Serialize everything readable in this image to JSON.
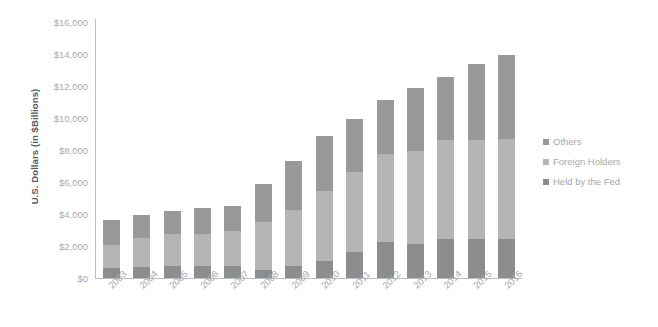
{
  "chart_data": {
    "type": "bar",
    "stacked": true,
    "title": "",
    "xlabel": "",
    "ylabel": "U.S. Dollars (in $Billions)",
    "categories": [
      "2003",
      "2004",
      "2005",
      "2006",
      "2007",
      "2008",
      "2009",
      "2010",
      "2011",
      "2012",
      "2013",
      "2014",
      "2015",
      "2016"
    ],
    "series": [
      {
        "name": "Held by the Fed",
        "color": "#8c8d8f",
        "values": [
          650,
          700,
          725,
          750,
          750,
          475,
          750,
          1050,
          1650,
          2250,
          2150,
          2450,
          2450,
          2450
        ]
      },
      {
        "name": "Foreign Holders",
        "color": "#b4b5b7",
        "values": [
          1400,
          1800,
          2000,
          2000,
          2200,
          3000,
          3500,
          4400,
          5000,
          5500,
          5800,
          6150,
          6200,
          6250
        ]
      },
      {
        "name": "Others",
        "color": "#97999b",
        "values": [
          1600,
          1450,
          1475,
          1600,
          1550,
          2400,
          3050,
          3400,
          3300,
          3350,
          3950,
          3950,
          4700,
          5250
        ]
      }
    ],
    "y_ticks": [
      {
        "label": "$16,000",
        "value": 16000
      },
      {
        "label": "$14,000",
        "value": 14000
      },
      {
        "label": "$12,000",
        "value": 12000
      },
      {
        "label": "$10,000",
        "value": 10000
      },
      {
        "label": "$8,000",
        "value": 8000
      },
      {
        "label": "$6,000",
        "value": 6000
      },
      {
        "label": "$4,000",
        "value": 4000
      },
      {
        "label": "$2,000",
        "value": 2000
      },
      {
        "label": "$0",
        "value": 0
      }
    ],
    "ylim": [
      0,
      16000
    ],
    "grid": false,
    "legend_position": "right",
    "totals": [
      3650,
      3950,
      4200,
      4350,
      4500,
      5875,
      7300,
      8850,
      9950,
      11100,
      11900,
      12550,
      13350,
      13950
    ],
    "axis_color": "#bcbec0",
    "tick_label_color": "#a7a9ac",
    "axis_title_color": "#58595b",
    "background": "#ffffff"
  }
}
